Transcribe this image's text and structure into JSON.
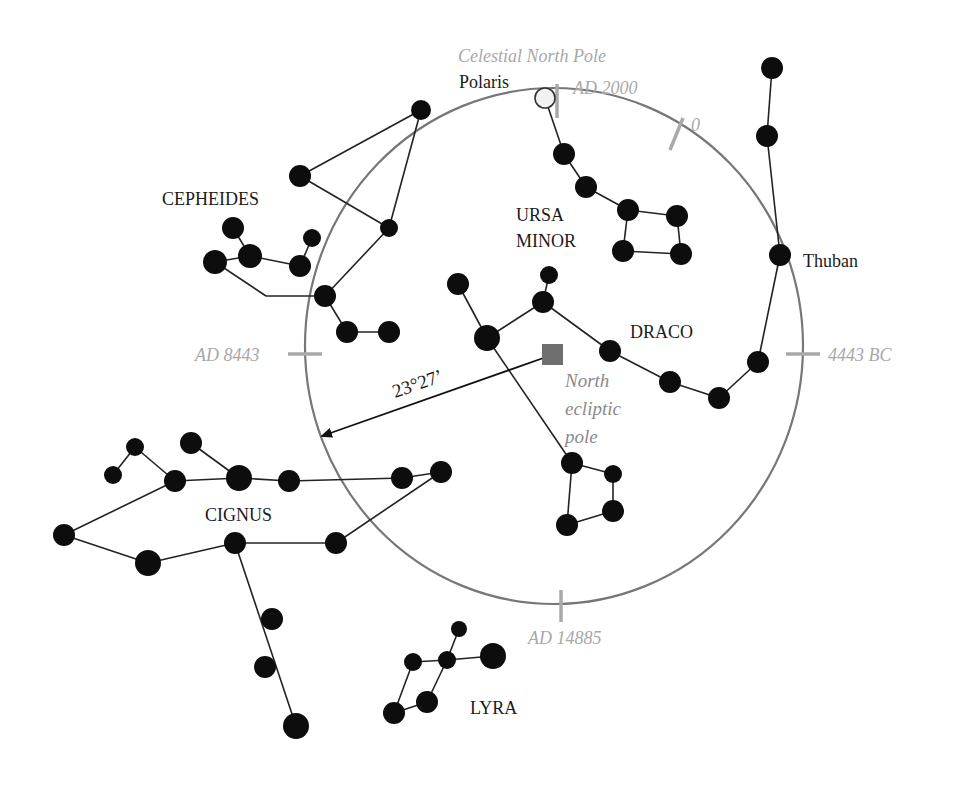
{
  "colors": {
    "star": "#0d0d0d",
    "edge": "#222222",
    "circle": "#777777",
    "tick": "#a9a9a9",
    "gray_text": "#a8a8a8",
    "ecliptic_pole": "#6e6e6e",
    "polaris_fill": "#f2f2f2"
  },
  "labels": {
    "celestial_north_pole": "Celestial North Pole",
    "polaris": "Polaris",
    "thuban": "Thuban",
    "north_ecliptic_pole_line1": "North",
    "north_ecliptic_pole_line2": "ecliptic",
    "north_ecliptic_pole_line3": "pole",
    "angle": "23°27’"
  },
  "epochs": {
    "top": "AD 2000",
    "upper_right": "0",
    "right": "4443 BC",
    "left": "AD 8443",
    "bottom": "AD 14885"
  },
  "constellations": {
    "cepheides": "CEPHEIDES",
    "ursa_minor_line1": "URSA",
    "ursa_minor_line2": "MINOR",
    "draco": "DRACO",
    "cignus": "CIGNUS",
    "lyra": "LYRA"
  },
  "icons": {
    "star": "filled-circle",
    "polaris": "hollow-circle",
    "ecliptic_pole": "filled-square",
    "arrow": "arrowhead"
  }
}
